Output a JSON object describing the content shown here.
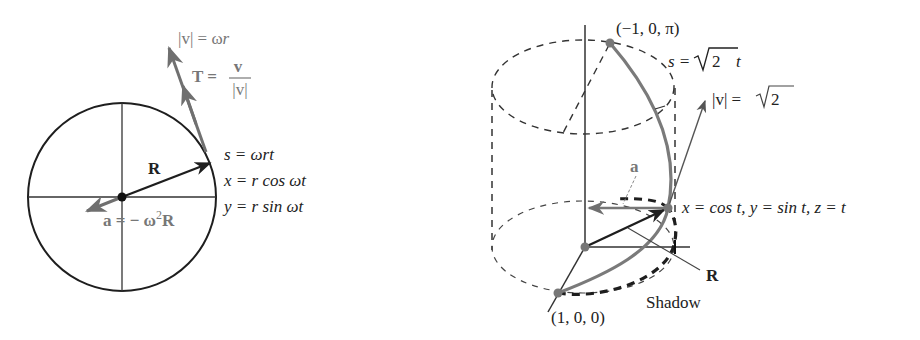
{
  "colors": {
    "ink": "#1e1e1e",
    "curve": "#7a7a7a",
    "label_gray": "#777777"
  },
  "left_diagram": {
    "title": "Uniform circular motion",
    "labels": {
      "speed_prefix": "|v| = ω",
      "speed_var": "r",
      "tangent_lhs": "T =",
      "tangent_num": "v",
      "tangent_den": "|v|",
      "radius_vector": "R",
      "accel_prefix": "a = − ω",
      "accel_exp": "2",
      "accel_suffix": "R",
      "arc_length": "s = ωrt",
      "x_param": "x = r cos ωt",
      "y_param": "y = r sin ωt"
    }
  },
  "right_diagram": {
    "title": "Helix on a cylinder",
    "labels": {
      "top_point": "(−1, 0, π)",
      "arc_length_prefix": "s =",
      "arc_length_sqrt": "2",
      "arc_length_var": "t",
      "speed_prefix": "|v| =",
      "speed_sqrt": "2",
      "accel": "a",
      "parametric": "x = cos t, y = sin t, z = t",
      "radius_vector": "R",
      "shadow": "Shadow",
      "start_point": "(1, 0, 0)"
    }
  }
}
